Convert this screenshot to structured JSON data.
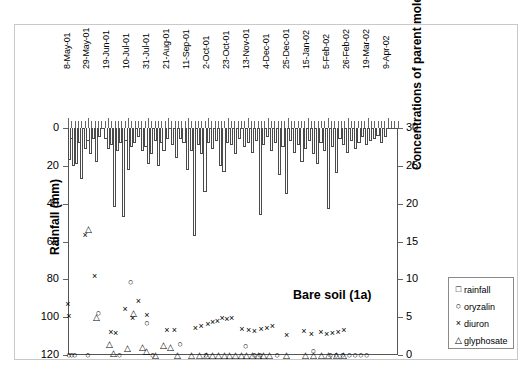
{
  "chart_data": {
    "type": "bar",
    "title": "Bare soil (1a)",
    "xlabel": "",
    "ylabel": "Rainfall (mm)",
    "y2label": "Concentrations of parent molecules (µg.L ⁻¹)",
    "ylim": [
      0,
      120
    ],
    "ylim_inverted": true,
    "y2lim": [
      0,
      30
    ],
    "yticks": [
      0,
      20,
      40,
      60,
      80,
      100,
      120
    ],
    "y2ticks": [
      0,
      5,
      10,
      15,
      20,
      25,
      30
    ],
    "grid": false,
    "legend_position": "bottom-right",
    "x_tick_labels": [
      "8-May-01",
      "29-May-01",
      "19-Jun-01",
      "10-Jul-01",
      "31-Jul-01",
      "21-Aug-01",
      "11-Sep-01",
      "2-Oct-01",
      "23-Oct-01",
      "13-Nov-01",
      "4-Dec-01",
      "25-Dec-01",
      "15-Jan-02",
      "5-Feb-02",
      "26-Feb-02",
      "19-Mar-02",
      "9-Apr-02"
    ],
    "x_tick_label_positions": [
      0,
      21,
      42,
      63,
      84,
      105,
      126,
      147,
      168,
      189,
      210,
      231,
      252,
      273,
      294,
      315,
      336
    ],
    "x_range_days": [
      0,
      347
    ],
    "series": [
      {
        "name": "rainfall",
        "marker": "square",
        "type": "bar",
        "axis": "left",
        "unit": "mm",
        "points": [
          [
            2,
            17
          ],
          [
            4,
            6
          ],
          [
            6,
            20
          ],
          [
            9,
            19
          ],
          [
            12,
            8
          ],
          [
            14,
            27
          ],
          [
            18,
            11
          ],
          [
            21,
            7
          ],
          [
            24,
            14
          ],
          [
            27,
            6
          ],
          [
            30,
            18
          ],
          [
            33,
            5
          ],
          [
            40,
            6
          ],
          [
            43,
            11
          ],
          [
            46,
            9
          ],
          [
            49,
            42
          ],
          [
            52,
            12
          ],
          [
            55,
            8
          ],
          [
            58,
            47
          ],
          [
            61,
            7
          ],
          [
            64,
            22
          ],
          [
            67,
            10
          ],
          [
            70,
            8
          ],
          [
            74,
            5
          ],
          [
            78,
            12
          ],
          [
            82,
            10
          ],
          [
            85,
            19
          ],
          [
            88,
            14
          ],
          [
            92,
            7
          ],
          [
            95,
            20
          ],
          [
            98,
            8
          ],
          [
            101,
            12
          ],
          [
            105,
            6
          ],
          [
            110,
            9
          ],
          [
            114,
            16
          ],
          [
            118,
            6
          ],
          [
            122,
            8
          ],
          [
            126,
            22
          ],
          [
            130,
            12
          ],
          [
            133,
            57
          ],
          [
            137,
            9
          ],
          [
            140,
            14
          ],
          [
            144,
            34
          ],
          [
            148,
            8
          ],
          [
            152,
            11
          ],
          [
            156,
            7
          ],
          [
            160,
            20
          ],
          [
            164,
            23
          ],
          [
            168,
            8
          ],
          [
            172,
            9
          ],
          [
            176,
            14
          ],
          [
            180,
            6
          ],
          [
            186,
            10
          ],
          [
            190,
            8
          ],
          [
            194,
            13
          ],
          [
            198,
            7
          ],
          [
            202,
            46
          ],
          [
            206,
            9
          ],
          [
            210,
            5
          ],
          [
            214,
            12
          ],
          [
            218,
            8
          ],
          [
            222,
            25
          ],
          [
            226,
            10
          ],
          [
            230,
            35
          ],
          [
            234,
            7
          ],
          [
            238,
            13
          ],
          [
            242,
            9
          ],
          [
            246,
            18
          ],
          [
            250,
            11
          ],
          [
            254,
            7
          ],
          [
            258,
            14
          ],
          [
            262,
            19
          ],
          [
            266,
            8
          ],
          [
            270,
            12
          ],
          [
            274,
            43
          ],
          [
            278,
            10
          ],
          [
            282,
            24
          ],
          [
            286,
            6
          ],
          [
            290,
            9
          ],
          [
            294,
            13
          ],
          [
            298,
            7
          ],
          [
            302,
            11
          ],
          [
            306,
            8
          ],
          [
            310,
            5
          ],
          [
            314,
            9
          ],
          [
            318,
            7
          ],
          [
            322,
            6
          ],
          [
            326,
            4
          ],
          [
            330,
            8
          ],
          [
            334,
            5
          ]
        ]
      },
      {
        "name": "oryzalin",
        "marker": "circle",
        "type": "scatter",
        "axis": "right",
        "unit": "µg.L-1",
        "points": [
          [
            1,
            0.05
          ],
          [
            4,
            0.05
          ],
          [
            7,
            0.05
          ],
          [
            21,
            0.05
          ],
          [
            32,
            5.6
          ],
          [
            54,
            0.05
          ],
          [
            66,
            9.6
          ],
          [
            83,
            4.2
          ],
          [
            89,
            0.05
          ],
          [
            118,
            1.5
          ],
          [
            145,
            0.05
          ],
          [
            187,
            1.2
          ],
          [
            196,
            0.05
          ],
          [
            202,
            0.05
          ],
          [
            220,
            0.05
          ],
          [
            258,
            0.6
          ],
          [
            276,
            0.05
          ],
          [
            282,
            0.05
          ],
          [
            289,
            0.05
          ],
          [
            296,
            0.05
          ],
          [
            302,
            0.05
          ],
          [
            308,
            0.05
          ],
          [
            314,
            0.05
          ]
        ]
      },
      {
        "name": "diuron",
        "marker": "cross",
        "type": "scatter",
        "axis": "right",
        "unit": "µg.L-1",
        "points": [
          [
            0,
            6.7
          ],
          [
            1,
            5.1
          ],
          [
            18,
            15.8
          ],
          [
            28,
            10.4
          ],
          [
            45,
            3.0
          ],
          [
            50,
            2.9
          ],
          [
            60,
            6.1
          ],
          [
            68,
            4.9
          ],
          [
            74,
            7.1
          ],
          [
            83,
            5.3
          ],
          [
            104,
            3.3
          ],
          [
            112,
            3.3
          ],
          [
            134,
            3.6
          ],
          [
            140,
            3.8
          ],
          [
            147,
            4.1
          ],
          [
            152,
            4.4
          ],
          [
            157,
            4.5
          ],
          [
            162,
            4.9
          ],
          [
            167,
            4.8
          ],
          [
            172,
            4.9
          ],
          [
            183,
            3.5
          ],
          [
            190,
            3.3
          ],
          [
            196,
            3.2
          ],
          [
            203,
            3.4
          ],
          [
            209,
            3.6
          ],
          [
            215,
            3.8
          ],
          [
            230,
            2.6
          ],
          [
            248,
            3.2
          ],
          [
            256,
            2.8
          ],
          [
            266,
            3.0
          ],
          [
            272,
            2.8
          ],
          [
            278,
            2.9
          ],
          [
            284,
            3.1
          ],
          [
            290,
            3.3
          ]
        ]
      },
      {
        "name": "glyphosate",
        "marker": "triangle",
        "type": "scatter",
        "axis": "right",
        "unit": "µg.L-1",
        "points": [
          [
            22,
            16.6
          ],
          [
            30,
            5.0
          ],
          [
            44,
            1.4
          ],
          [
            48,
            0.3
          ],
          [
            63,
            0.9
          ],
          [
            69,
            5.6
          ],
          [
            78,
            1.1
          ],
          [
            83,
            0.5
          ],
          [
            92,
            0.05
          ],
          [
            100,
            1.3
          ],
          [
            108,
            1.0
          ],
          [
            115,
            0.05
          ],
          [
            130,
            0.05
          ],
          [
            138,
            0.05
          ],
          [
            146,
            0.05
          ],
          [
            152,
            0.05
          ],
          [
            158,
            0.05
          ],
          [
            164,
            0.05
          ],
          [
            170,
            0.05
          ],
          [
            176,
            0.05
          ],
          [
            182,
            0.05
          ],
          [
            188,
            0.05
          ],
          [
            194,
            0.05
          ],
          [
            200,
            0.05
          ],
          [
            206,
            0.05
          ],
          [
            212,
            0.05
          ],
          [
            230,
            0.05
          ],
          [
            250,
            0.05
          ],
          [
            258,
            0.05
          ],
          [
            266,
            0.05
          ],
          [
            274,
            0.05
          ],
          [
            282,
            0.05
          ],
          [
            290,
            0.05
          ]
        ]
      }
    ],
    "legend": [
      {
        "label": "rainfall",
        "symbol": "□"
      },
      {
        "label": "oryzalin",
        "symbol": "○"
      },
      {
        "label": "diuron",
        "symbol": "×"
      },
      {
        "label": "glyphosate",
        "symbol": "△"
      }
    ]
  }
}
